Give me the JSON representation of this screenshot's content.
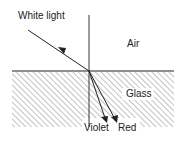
{
  "diagram": {
    "labels": {
      "incident": "White light",
      "upper_medium": "Air",
      "lower_medium": "Glass",
      "ray_violet": "Violet",
      "ray_red": "Red"
    },
    "colors": {
      "line": "#222222",
      "hatch": "#888888",
      "background": "#ffffff"
    }
  }
}
